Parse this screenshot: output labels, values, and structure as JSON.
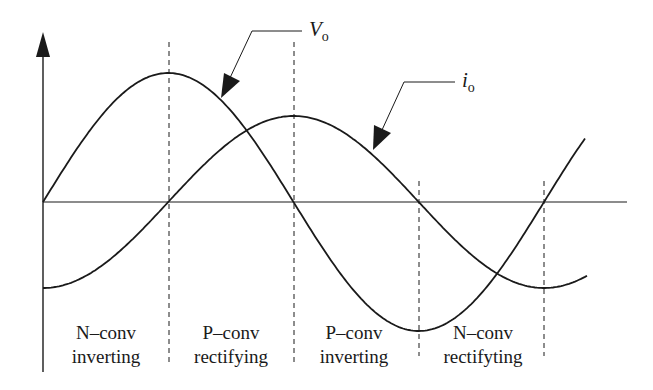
{
  "diagram": {
    "title": "",
    "colors": {
      "stroke": "#1a1a1a",
      "background": "#ffffff"
    },
    "axes": {
      "origin": [
        43,
        202
      ],
      "y_axis_top": 32,
      "y_axis_bottom": 372,
      "x_axis_end": 627
    },
    "signals": [
      {
        "id": "vo",
        "label_main": "V",
        "label_sub": "o",
        "amplitude": 129,
        "phase_deg": 0
      },
      {
        "id": "io",
        "label_main": "i",
        "label_sub": "o",
        "amplitude": 86,
        "phase_deg": -90
      }
    ],
    "dividers_x": [
      169,
      294,
      419,
      544
    ],
    "regions": [
      {
        "line1": "N–conv",
        "line2": "inverting"
      },
      {
        "line1": "P–conv",
        "line2": "rectifying"
      },
      {
        "line1": "P–conv",
        "line2": "inverting"
      },
      {
        "line1": "N–conv",
        "line2": "rectifyting"
      }
    ]
  }
}
